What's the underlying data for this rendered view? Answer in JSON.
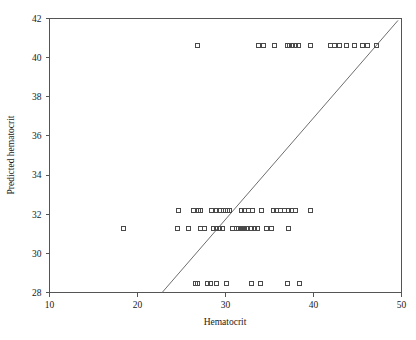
{
  "chart_data": {
    "type": "scatter",
    "title": "",
    "xlabel": "Hematocrit",
    "ylabel": "Predicted hematocrit",
    "xlim": [
      10,
      50
    ],
    "ylim": [
      28,
      42
    ],
    "xticks": [
      10,
      20,
      30,
      40,
      50
    ],
    "yticks": [
      28,
      30,
      32,
      34,
      36,
      38,
      40,
      42
    ],
    "xtick_labels": [
      "10",
      "20",
      "30",
      "40",
      "50"
    ],
    "ytick_labels": [
      "28",
      "30",
      "32",
      "34",
      "36",
      "38",
      "40",
      "42"
    ],
    "grid": false,
    "legend": null,
    "marker_style": "open-square",
    "marker_color": "#4a4a4a",
    "reference_line": {
      "name": "identity-line",
      "type": "line",
      "color": "#6e6e6e",
      "x": [
        22.8,
        49.6
      ],
      "y": [
        28.0,
        41.9
      ]
    },
    "series": [
      {
        "name": "Predicted vs observed hematocrit",
        "marker": "open-square",
        "points": [
          [
            26.8,
            40.6
          ],
          [
            33.8,
            40.6
          ],
          [
            34.3,
            40.6
          ],
          [
            35.6,
            40.6
          ],
          [
            37.0,
            40.6
          ],
          [
            37.3,
            40.6
          ],
          [
            37.6,
            40.6
          ],
          [
            37.9,
            40.6
          ],
          [
            38.3,
            40.6
          ],
          [
            39.6,
            40.6
          ],
          [
            41.9,
            40.6
          ],
          [
            42.4,
            40.6
          ],
          [
            43.0,
            40.6
          ],
          [
            43.8,
            40.6
          ],
          [
            44.6,
            40.6
          ],
          [
            45.6,
            40.6
          ],
          [
            46.1,
            40.6
          ],
          [
            47.2,
            40.6
          ],
          [
            24.6,
            32.2
          ],
          [
            26.4,
            32.2
          ],
          [
            26.9,
            32.2
          ],
          [
            27.2,
            32.2
          ],
          [
            28.4,
            32.2
          ],
          [
            29.0,
            32.2
          ],
          [
            29.3,
            32.2
          ],
          [
            29.8,
            32.2
          ],
          [
            30.0,
            32.2
          ],
          [
            30.2,
            32.2
          ],
          [
            30.4,
            32.2
          ],
          [
            31.8,
            32.2
          ],
          [
            32.2,
            32.2
          ],
          [
            32.6,
            32.2
          ],
          [
            33.1,
            32.2
          ],
          [
            34.1,
            32.2
          ],
          [
            35.4,
            32.2
          ],
          [
            35.8,
            32.2
          ],
          [
            36.2,
            32.2
          ],
          [
            36.7,
            32.2
          ],
          [
            37.1,
            32.2
          ],
          [
            37.5,
            32.2
          ],
          [
            38.0,
            32.2
          ],
          [
            39.6,
            32.2
          ],
          [
            18.4,
            31.25
          ],
          [
            24.5,
            31.25
          ],
          [
            25.8,
            31.25
          ],
          [
            27.2,
            31.25
          ],
          [
            27.6,
            31.25
          ],
          [
            28.6,
            31.25
          ],
          [
            29.0,
            31.25
          ],
          [
            29.3,
            31.25
          ],
          [
            29.6,
            31.25
          ],
          [
            30.8,
            31.25
          ],
          [
            31.2,
            31.25
          ],
          [
            31.5,
            31.25
          ],
          [
            31.8,
            31.25
          ],
          [
            32.0,
            31.25
          ],
          [
            32.2,
            31.25
          ],
          [
            32.4,
            31.25
          ],
          [
            33.0,
            31.25
          ],
          [
            33.3,
            31.25
          ],
          [
            33.6,
            31.25
          ],
          [
            34.6,
            31.25
          ],
          [
            35.2,
            31.25
          ],
          [
            37.1,
            31.25
          ],
          [
            26.6,
            28.45
          ],
          [
            26.8,
            28.45
          ],
          [
            27.9,
            28.45
          ],
          [
            28.3,
            28.45
          ],
          [
            29.0,
            28.45
          ],
          [
            30.1,
            28.45
          ],
          [
            32.9,
            28.45
          ],
          [
            34.0,
            28.45
          ],
          [
            37.0,
            28.45
          ],
          [
            38.4,
            28.45
          ]
        ]
      }
    ]
  },
  "axes": {
    "x_title": "Hematocrit",
    "y_title": "Predicted hematocrit"
  }
}
